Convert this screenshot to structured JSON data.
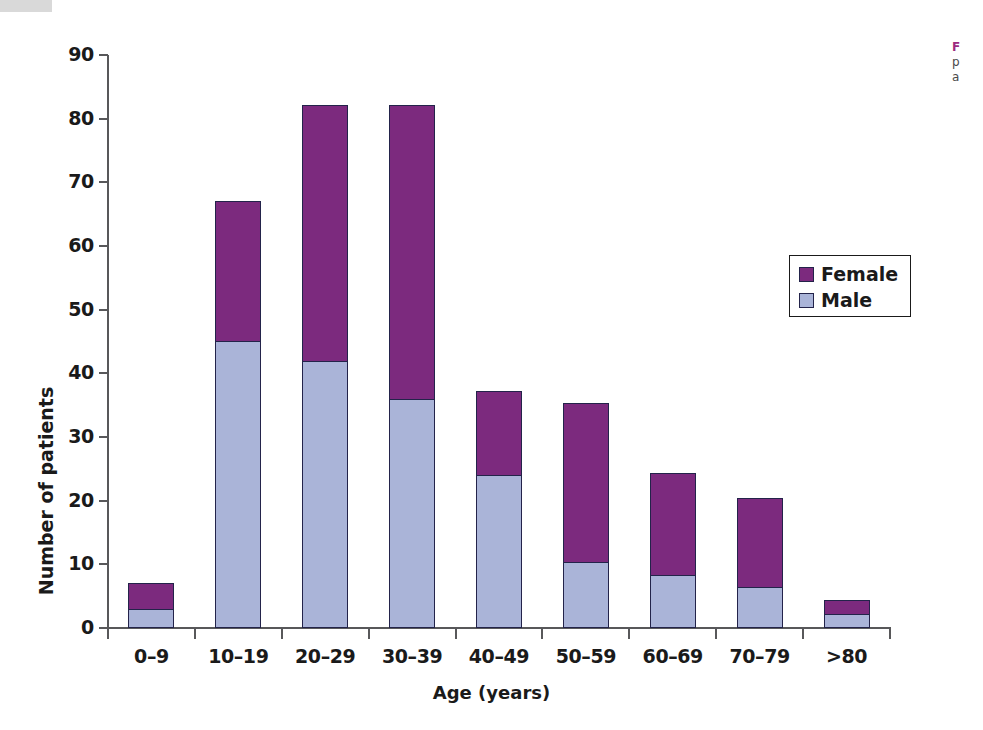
{
  "figure": {
    "legend": {
      "entries": [
        {
          "label": "Female",
          "color": "#7c2a7e"
        },
        {
          "label": "Male",
          "color": "#aab4d8"
        }
      ]
    },
    "caption": {
      "title": "F",
      "line2": "p",
      "line3": "a"
    }
  },
  "chart_data": {
    "type": "bar",
    "subtype": "stacked-vertical",
    "title": "",
    "xlabel": "Age (years)",
    "ylabel": "Number of patients",
    "ylim": [
      0,
      90
    ],
    "yticks": [
      0,
      10,
      20,
      30,
      40,
      50,
      60,
      70,
      80,
      90
    ],
    "ytick_labels": [
      "0",
      "10",
      "20",
      "30",
      "40",
      "50",
      "60",
      "70",
      "80",
      "90"
    ],
    "grid": false,
    "legend_position": "inside-upper-right",
    "categories": [
      "0–9",
      "10–19",
      "20–29",
      "30–39",
      "40–49",
      "50–59",
      "60–69",
      "70–79",
      ">80"
    ],
    "series": [
      {
        "name": "Male",
        "color": "#aab4d8",
        "values": [
          3,
          45,
          42,
          36,
          24,
          10.3,
          8.3,
          6.4,
          2.2
        ]
      },
      {
        "name": "Female",
        "color": "#7c2a7e",
        "values": [
          4.1,
          22,
          40.2,
          46.2,
          13.2,
          25,
          16.1,
          14,
          2.2
        ]
      }
    ],
    "totals": [
      7.1,
      67,
      82.2,
      82.2,
      37.2,
      35.3,
      24.4,
      20.4,
      4.4
    ]
  }
}
